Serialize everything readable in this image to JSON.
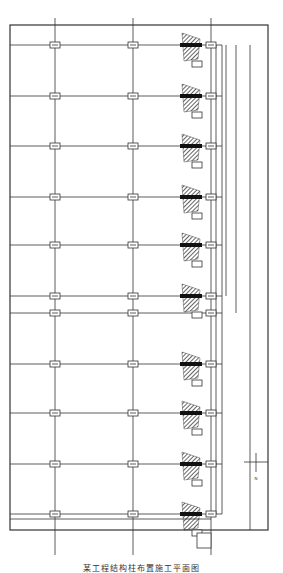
{
  "drawing": {
    "caption": "某工程结构柱布置施工平面图",
    "north_marker_label": "N",
    "colors": {
      "line": "#333333",
      "hatch": "#222222",
      "background": "#ffffff"
    },
    "grid": {
      "columns_x": [
        55,
        133,
        211
      ],
      "rows_y": [
        45,
        96,
        146,
        197,
        245,
        296,
        313,
        364,
        413,
        464,
        514
      ]
    },
    "border": {
      "x1": 10,
      "y1": 25,
      "x2": 268,
      "y2": 530
    },
    "column_count": 33,
    "hatched_elements_rows": [
      45,
      96,
      146,
      197,
      245,
      296,
      364,
      413,
      464,
      514
    ]
  }
}
